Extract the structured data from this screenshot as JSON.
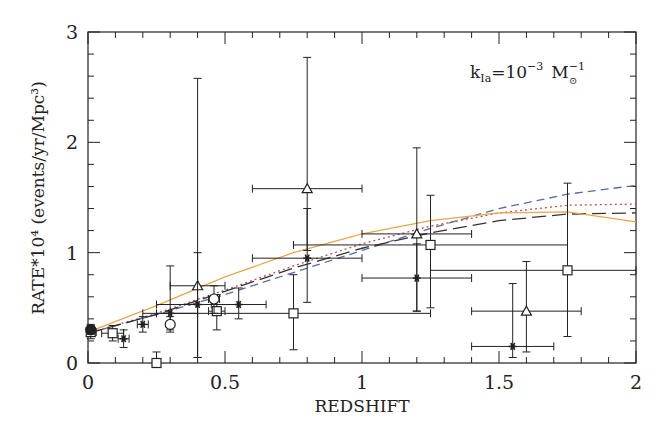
{
  "chart_data": {
    "type": "scatter",
    "title": "",
    "annotation": "k_Ia = 10^-3 M_sun^-1",
    "annotation_parts": {
      "k": "k",
      "sub": "Ia",
      "eq": "=10",
      "exp": "−3",
      "unit": "M",
      "unit_exp": "−1",
      "sun": "⊙"
    },
    "xlabel": "REDSHIFT",
    "ylabel": "RATE*10⁴ (events/yr/Mpc³)",
    "xlim": [
      0,
      2
    ],
    "ylim": [
      0,
      3
    ],
    "xticks": [
      "0",
      "0.5",
      "1",
      "1.5",
      "2"
    ],
    "yticks": [
      "0",
      "1",
      "2",
      "3"
    ],
    "grid": false,
    "legend": null,
    "series": [
      {
        "name": "triangles",
        "marker": "triangle",
        "points": [
          {
            "x": 0.4,
            "y": 0.7,
            "xerr": [
              0.3,
              0.5
            ],
            "yerr": [
              0.05,
              2.58
            ]
          },
          {
            "x": 0.8,
            "y": 1.58,
            "xerr": [
              0.6,
              1.0
            ],
            "yerr": [
              1.02,
              2.77
            ]
          },
          {
            "x": 1.2,
            "y": 1.17,
            "xerr": [
              1.0,
              1.4
            ],
            "yerr": [
              0.47,
              1.95
            ]
          },
          {
            "x": 1.6,
            "y": 0.47,
            "xerr": [
              1.4,
              1.8
            ],
            "yerr": [
              0.1,
              0.92
            ]
          }
        ]
      },
      {
        "name": "squares",
        "marker": "square",
        "points": [
          {
            "x": 0.01,
            "y": 0.28,
            "xerr": [
              0.0,
              0.03
            ],
            "yerr": [
              0.22,
              0.35
            ]
          },
          {
            "x": 0.09,
            "y": 0.27,
            "xerr": [
              0.05,
              0.13
            ],
            "yerr": [
              0.2,
              0.34
            ]
          },
          {
            "x": 0.25,
            "y": 0.0,
            "xerr": [
              0.24,
              0.26
            ],
            "yerr": [
              0.0,
              0.1
            ]
          },
          {
            "x": 0.47,
            "y": 0.47,
            "xerr": [
              0.44,
              0.5
            ],
            "yerr": [
              0.3,
              0.62
            ]
          },
          {
            "x": 0.75,
            "y": 0.45,
            "xerr": [
              0.25,
              1.25
            ],
            "yerr": [
              0.12,
              0.8
            ]
          },
          {
            "x": 1.25,
            "y": 1.07,
            "xerr": [
              0.75,
              1.75
            ],
            "yerr": [
              0.5,
              1.52
            ]
          },
          {
            "x": 1.75,
            "y": 0.84,
            "xerr": [
              1.25,
              2.0
            ],
            "yerr": [
              0.24,
              1.63
            ]
          }
        ]
      },
      {
        "name": "stars",
        "marker": "asterisk",
        "points": [
          {
            "x": 0.13,
            "y": 0.22,
            "xerr": [
              0.11,
              0.15
            ],
            "yerr": [
              0.14,
              0.3
            ]
          },
          {
            "x": 0.2,
            "y": 0.35,
            "xerr": [
              0.18,
              0.22
            ],
            "yerr": [
              0.28,
              0.42
            ]
          },
          {
            "x": 0.3,
            "y": 0.45,
            "xerr": [
              0.2,
              0.4
            ],
            "yerr": [
              0.3,
              0.88
            ]
          },
          {
            "x": 0.4,
            "y": 0.53,
            "xerr": [
              0.25,
              0.55
            ],
            "yerr": [
              0.05,
              1.0
            ]
          },
          {
            "x": 0.55,
            "y": 0.53,
            "xerr": [
              0.45,
              0.65
            ],
            "yerr": [
              0.4,
              0.68
            ]
          },
          {
            "x": 0.8,
            "y": 0.95,
            "xerr": [
              0.6,
              1.0
            ],
            "yerr": [
              0.55,
              1.4
            ]
          },
          {
            "x": 1.2,
            "y": 0.77,
            "xerr": [
              1.0,
              1.4
            ],
            "yerr": [
              0.47,
              1.08
            ]
          },
          {
            "x": 1.55,
            "y": 0.15,
            "xerr": [
              1.4,
              1.7
            ],
            "yerr": [
              0.05,
              0.72
            ]
          }
        ]
      },
      {
        "name": "circles",
        "marker": "circle",
        "points": [
          {
            "x": 0.01,
            "y": 0.3,
            "xerr": [
              0.0,
              0.02
            ],
            "yerr": [
              0.26,
              0.34
            ]
          },
          {
            "x": 0.3,
            "y": 0.35,
            "xerr": [
              0.29,
              0.31
            ],
            "yerr": [
              0.28,
              0.42
            ]
          },
          {
            "x": 0.46,
            "y": 0.58,
            "xerr": [
              0.44,
              0.48
            ],
            "yerr": [
              0.45,
              0.7
            ]
          }
        ]
      }
    ],
    "curves": [
      {
        "name": "short-dashed (blue)",
        "color": "#5a6aa8",
        "dash": "8,5",
        "x": [
          0,
          0.25,
          0.5,
          0.75,
          1,
          1.25,
          1.5,
          1.75,
          2
        ],
        "y": [
          0.27,
          0.44,
          0.62,
          0.82,
          1.02,
          1.22,
          1.4,
          1.53,
          1.61
        ]
      },
      {
        "name": "dotted (red)",
        "color": "#c05050",
        "dash": "2,3",
        "x": [
          0,
          0.25,
          0.5,
          0.75,
          1,
          1.25,
          1.5,
          1.75,
          2
        ],
        "y": [
          0.27,
          0.45,
          0.66,
          0.88,
          1.08,
          1.24,
          1.36,
          1.43,
          1.44
        ]
      },
      {
        "name": "long-dashed (black)",
        "color": "#333333",
        "dash": "14,6",
        "x": [
          0,
          0.25,
          0.5,
          0.75,
          1,
          1.25,
          1.5,
          1.75,
          2
        ],
        "y": [
          0.27,
          0.44,
          0.65,
          0.86,
          1.04,
          1.18,
          1.29,
          1.35,
          1.36
        ]
      },
      {
        "name": "solid (orange)",
        "color": "#e8a84a",
        "dash": "",
        "x": [
          0,
          0.25,
          0.5,
          0.75,
          1,
          1.25,
          1.5,
          1.75,
          2
        ],
        "y": [
          0.28,
          0.52,
          0.78,
          1.0,
          1.17,
          1.29,
          1.36,
          1.37,
          1.28
        ]
      }
    ]
  }
}
